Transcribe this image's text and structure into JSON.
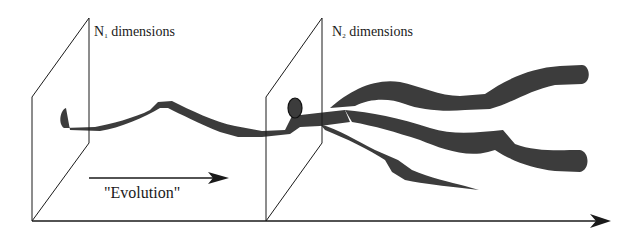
{
  "diagram": {
    "planes": [
      {
        "label_prefix": "N",
        "label_sub": "1",
        "label_suffix": " dimensions"
      },
      {
        "label_prefix": "N",
        "label_sub": "2",
        "label_suffix": " dimensions"
      }
    ],
    "evolution_label": "\"Evolution\"",
    "colors": {
      "tube_fill": "#3c3c3c",
      "line": "#1a1a1a",
      "background": "#ffffff"
    }
  }
}
